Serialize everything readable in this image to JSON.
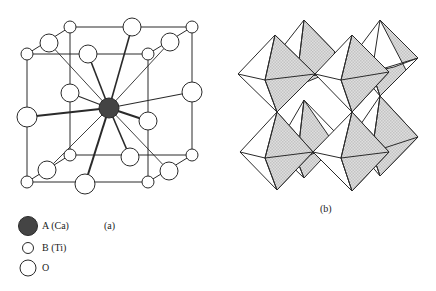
{
  "figure": {
    "panel_a": {
      "caption": "(a)",
      "description": "Perovskite ABO3 unit cell with A cation at body center, B cations at cube corners, O anions at edge midpoints",
      "center_atom": "A (Ca)"
    },
    "panel_b": {
      "caption": "(b)",
      "description": "Corner-sharing BO6 octahedra framework"
    },
    "legend": {
      "items": [
        {
          "symbol": "filled-large-circle",
          "label": "A (Ca)",
          "color": "#444444"
        },
        {
          "symbol": "small-open-circle",
          "label": "B (Ti)",
          "color": "#ffffff"
        },
        {
          "symbol": "large-open-circle",
          "label": "O",
          "color": "#ffffff"
        }
      ]
    },
    "colors": {
      "line": "#2a2a2a",
      "a_atom": "#444444",
      "octahedron_shade": "#d4d4d4"
    }
  }
}
